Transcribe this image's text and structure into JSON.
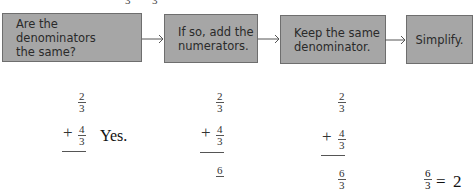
{
  "top_cutoff": {
    "chars": [
      "3",
      "3"
    ]
  },
  "flowchart": {
    "steps": [
      {
        "lines": [
          "Are the denominators",
          "the same?"
        ]
      },
      {
        "lines": [
          "If so, add the",
          "numerators."
        ]
      },
      {
        "lines": [
          "Keep the same",
          "denominator."
        ]
      },
      {
        "lines": [
          "Simplify."
        ]
      }
    ],
    "box_fill": "#a6a6a6",
    "box_border": "#6e6e6e"
  },
  "examples": {
    "step1": {
      "addend1": {
        "num": "2",
        "den": "3"
      },
      "plus": "+",
      "addend2": {
        "num": "4",
        "den": "3"
      },
      "answer": "Yes."
    },
    "step2": {
      "addend1": {
        "num": "2",
        "den": "3"
      },
      "plus": "+",
      "addend2": {
        "num": "4",
        "den": "3"
      },
      "sum_num": "6"
    },
    "step3": {
      "addend1": {
        "num": "2",
        "den": "3"
      },
      "plus": "+",
      "addend2": {
        "num": "4",
        "den": "3"
      },
      "sum": {
        "num": "6",
        "den": "3"
      }
    },
    "step4": {
      "fraction": {
        "num": "6",
        "den": "3"
      },
      "equals": "=",
      "result": "2"
    }
  }
}
